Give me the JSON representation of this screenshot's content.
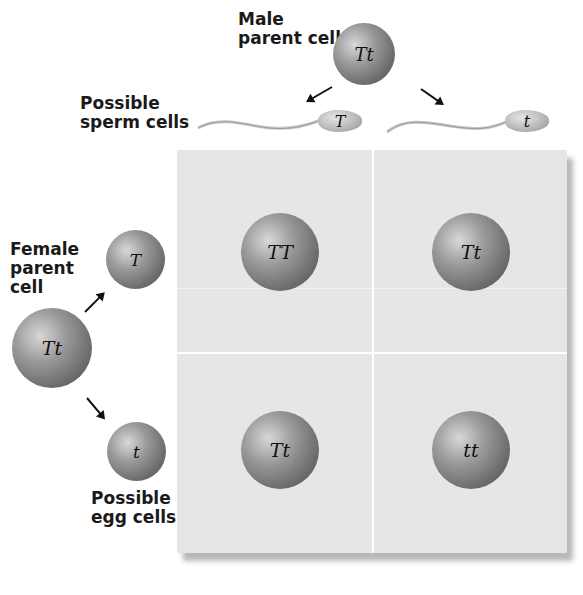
{
  "labels": {
    "male_parent": [
      "Male",
      "parent cell"
    ],
    "possible_sperm": [
      "Possible",
      "sperm cells"
    ],
    "female_parent": [
      "Female",
      "parent",
      "cell"
    ],
    "possible_egg": [
      "Possible",
      "egg cells"
    ]
  },
  "male_parent_genotype": "Tt",
  "female_parent_genotype": "Tt",
  "sperm": [
    {
      "allele": "T"
    },
    {
      "allele": "t"
    }
  ],
  "eggs": [
    {
      "allele": "T"
    },
    {
      "allele": "t"
    }
  ],
  "punnett_square": {
    "rows": [
      [
        "TT",
        "Tt"
      ],
      [
        "Tt",
        "tt"
      ]
    ]
  },
  "colors": {
    "grid_background": "#e6e6e6",
    "cell_gray": "#7a7a7a",
    "text": "#1a1a1a"
  }
}
